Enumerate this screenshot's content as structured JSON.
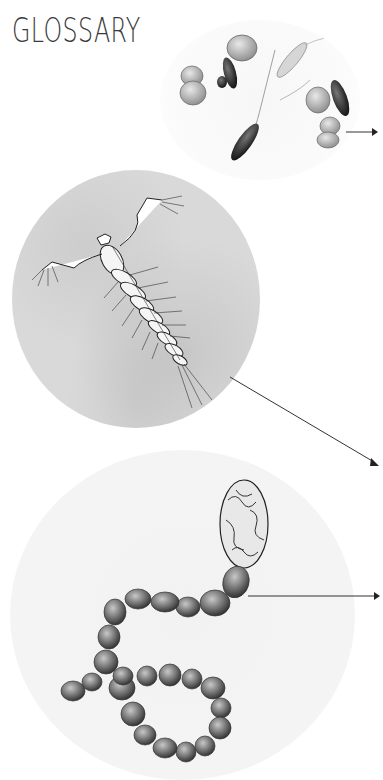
{
  "page": {
    "title": "GLOSSARY"
  },
  "illustrations": [
    {
      "id": "plankton-cluster",
      "description": "cluster of phytoplankton and diatom cells",
      "shape": "circle"
    },
    {
      "id": "copepod-larva",
      "description": "crustacean larva (nauplius) on grey watercolor background",
      "shape": "circle"
    },
    {
      "id": "cyanobacteria-chain",
      "description": "bead-like filament chain with heterocyst",
      "shape": "circle"
    }
  ],
  "arrows": [
    {
      "id": "arrow-1",
      "from": [
        346,
        132
      ],
      "to": [
        376,
        132
      ],
      "direction": "right"
    },
    {
      "id": "arrow-2",
      "from": [
        230,
        377
      ],
      "to": [
        378,
        465
      ],
      "direction": "down-right"
    },
    {
      "id": "arrow-3",
      "from": [
        248,
        596
      ],
      "to": [
        380,
        596
      ],
      "direction": "right"
    }
  ],
  "colors": {
    "background": "#ffffff",
    "title": "#3a3a3a",
    "arrow": "#333333",
    "circle2_bg": "#d9d9d9"
  }
}
